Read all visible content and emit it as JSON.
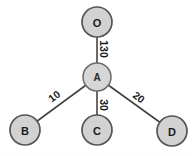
{
  "diagram": {
    "type": "weighted-star-graph",
    "background_color": "#ffffff",
    "node_fill_color": "#d2d2d2",
    "node_border_color": "#555555",
    "edge_color": "#444444",
    "label_color": "#1a1a1a",
    "nodes": [
      {
        "id": "O",
        "label": "O",
        "cx": 97,
        "cy": 22,
        "r": 15,
        "role": "leaf"
      },
      {
        "id": "A",
        "label": "A",
        "cx": 97,
        "cy": 77,
        "r": 14,
        "role": "center"
      },
      {
        "id": "B",
        "label": "B",
        "cx": 25,
        "cy": 130,
        "r": 15,
        "role": "leaf"
      },
      {
        "id": "C",
        "label": "C",
        "cx": 97,
        "cy": 130,
        "r": 15,
        "role": "leaf"
      },
      {
        "id": "D",
        "label": "D",
        "cx": 172,
        "cy": 131,
        "r": 15,
        "role": "leaf"
      }
    ],
    "edges": [
      {
        "id": "A-O",
        "from": "A",
        "to": "O",
        "weight": "130",
        "label_x": 104,
        "label_y": 49,
        "label_rotation": 90
      },
      {
        "id": "A-B",
        "from": "A",
        "to": "B",
        "weight": "10",
        "label_x": 54,
        "label_y": 96,
        "label_rotation": -37
      },
      {
        "id": "A-C",
        "from": "A",
        "to": "C",
        "weight": "30",
        "label_x": 104,
        "label_y": 105,
        "label_rotation": 90
      },
      {
        "id": "A-D",
        "from": "A",
        "to": "D",
        "weight": "20",
        "label_x": 139,
        "label_y": 97,
        "label_rotation": 37
      }
    ]
  }
}
